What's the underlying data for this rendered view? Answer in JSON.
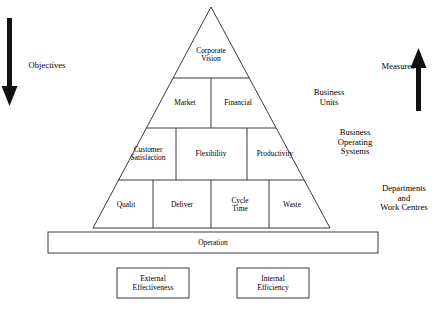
{
  "diagram": {
    "stroke_color": "#3a3a3a",
    "arrow_color": "#111111",
    "background": "#ffffff"
  },
  "pyramid": {
    "tiers": [
      {
        "name": "vision",
        "cells": [
          {
            "id": "corporate-vision",
            "label": "Corporate\nVision"
          }
        ]
      },
      {
        "name": "business-units",
        "cells": [
          {
            "id": "market",
            "label": "Market"
          },
          {
            "id": "financial",
            "label": "Financial"
          }
        ]
      },
      {
        "name": "business-operating-systems",
        "cells": [
          {
            "id": "customer-satisfaction",
            "label": "Customer\nSatisfaction"
          },
          {
            "id": "flexibility",
            "label": "Flexibility"
          },
          {
            "id": "productivity",
            "label": "Productivity"
          }
        ]
      },
      {
        "name": "departments-and-work-centres",
        "cells": [
          {
            "id": "quality",
            "label": "Qualit"
          },
          {
            "id": "delivery",
            "label": "Deliver"
          },
          {
            "id": "cycle-time",
            "label": "Cycle\nTime"
          },
          {
            "id": "waste",
            "label": "Waste"
          }
        ]
      }
    ]
  },
  "operation_bar": {
    "label": "Operation"
  },
  "bottom_boxes": [
    {
      "id": "external-effectiveness",
      "label": "External\nEffectiveness"
    },
    {
      "id": "internal-efficiency",
      "label": "Internal\nEfficiency"
    }
  ],
  "left_axis": {
    "label": "Objectives",
    "direction": "down"
  },
  "right_axis": {
    "label": "Measures",
    "direction": "up"
  },
  "right_labels": [
    {
      "id": "business-units",
      "label": "Business\nUnits"
    },
    {
      "id": "business-operating-systems",
      "label": "Business\nOperating\nSystems"
    },
    {
      "id": "departments-and-work-centres",
      "label": "Departments\nand\nWork Centres"
    }
  ]
}
